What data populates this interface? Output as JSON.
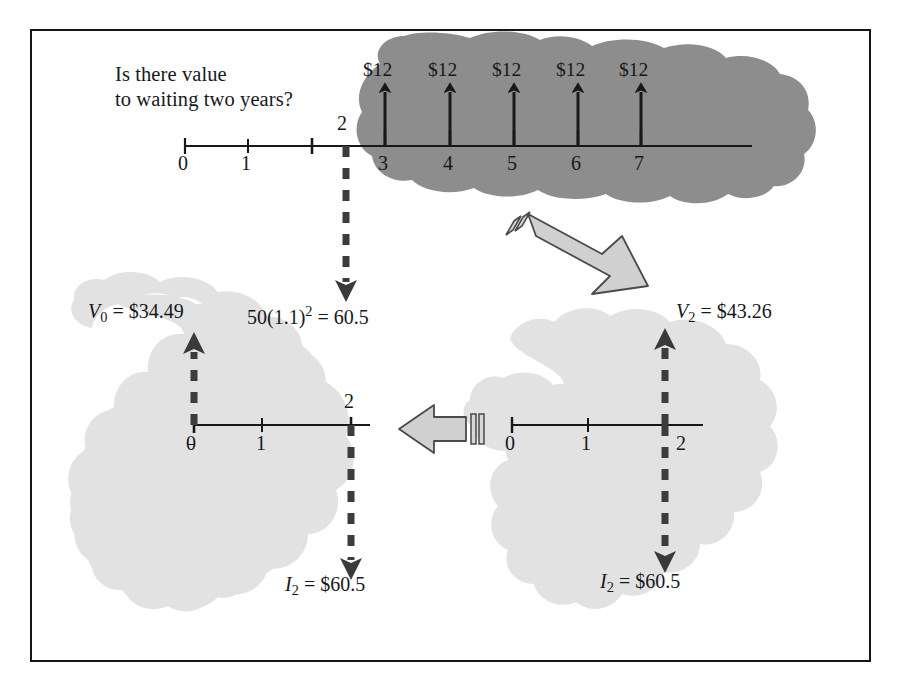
{
  "figure": {
    "title": "Is there value to waiting two years?",
    "border_color": "#15161a",
    "background": "#ffffff",
    "blob_dark_color": "#8d8d8d",
    "blob_light_color": "#e2e2e2",
    "block_arrow_fill": "#d0d0d0",
    "block_arrow_stroke": "#4a4a4a",
    "line_color": "#17181c"
  },
  "question": {
    "line1": "Is there value",
    "line2": "to waiting two years?"
  },
  "top_timeline": {
    "name": "original-cash-flow-timeline",
    "tick_labels": [
      "0",
      "1",
      "2",
      "3",
      "4",
      "5",
      "6",
      "7"
    ],
    "highlighted_tick": "2",
    "cash_flows": [
      {
        "period": "3",
        "amount": "$12"
      },
      {
        "period": "4",
        "amount": "$12"
      },
      {
        "period": "5",
        "amount": "$12"
      },
      {
        "period": "6",
        "amount": "$12"
      },
      {
        "period": "7",
        "amount": "$12"
      }
    ]
  },
  "formula": {
    "text": "50(1.1)2 = 60.5",
    "base": "50(1.1)",
    "exponent": "2",
    "result": "= 60.5"
  },
  "left_timeline": {
    "name": "present-value-timeline",
    "tick_labels": [
      "0",
      "1",
      "2"
    ],
    "inflow_label": {
      "symbol": "V",
      "subscript": "0",
      "equals": "=",
      "value": "$34.49",
      "full": "V0 = $34.49"
    },
    "outflow_label": {
      "symbol": "I",
      "subscript": "2",
      "equals": "=",
      "value": "$60.5",
      "full": "I2 = $60.5"
    }
  },
  "right_timeline": {
    "name": "year-two-value-timeline",
    "tick_labels": [
      "0",
      "1",
      "2"
    ],
    "inflow_label": {
      "symbol": "V",
      "subscript": "2",
      "equals": "=",
      "value": "$43.26",
      "full": "V2 = $43.26"
    },
    "outflow_label": {
      "symbol": "I",
      "subscript": "2",
      "equals": "=",
      "value": "$60.5",
      "full": "I2 = $60.5"
    }
  },
  "connectors": {
    "diagonal_arrow": "down-right-block-arrow",
    "horizontal_arrow": "left-block-arrow"
  }
}
